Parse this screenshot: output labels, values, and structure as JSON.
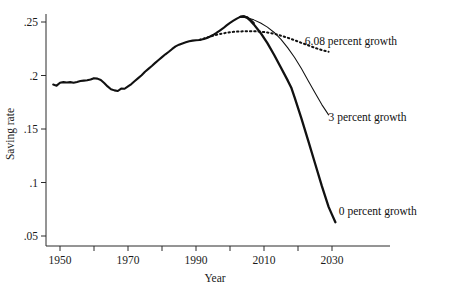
{
  "chart_data": {
    "type": "line",
    "title": "",
    "xlabel": "Year",
    "ylabel": "Saving rate",
    "xlim": [
      1946,
      2039
    ],
    "ylim": [
      0.042,
      0.262
    ],
    "grid": false,
    "legend": "inline-annotations",
    "x_ticks": [
      1950,
      1960,
      1970,
      1980,
      1990,
      2000,
      2010,
      2020,
      2030
    ],
    "x_tick_labels": [
      "1950",
      "",
      "1970",
      "",
      "1990",
      "",
      "2010",
      "",
      "2030"
    ],
    "y_ticks": [
      0.05,
      0.1,
      0.15,
      0.2,
      0.25
    ],
    "y_tick_labels": [
      ".05",
      ".1",
      ".15",
      ".2",
      ".25"
    ],
    "annotations": [
      {
        "name": "six-growth-label",
        "text": "6.08 percent growth",
        "x": 2022,
        "y": 0.232
      },
      {
        "name": "three-growth-label",
        "text": "3 percent growth",
        "x": 2029,
        "y": 0.161
      },
      {
        "name": "zero-growth-label",
        "text": "0 percent growth",
        "x": 2032,
        "y": 0.073
      }
    ],
    "series": [
      {
        "name": "Historical saving rate",
        "style": "solid-thick",
        "points": [
          [
            1948,
            0.1915
          ],
          [
            1949,
            0.1905
          ],
          [
            1950,
            0.1932
          ],
          [
            1951,
            0.1938
          ],
          [
            1952,
            0.1934
          ],
          [
            1953,
            0.1938
          ],
          [
            1954,
            0.1933
          ],
          [
            1955,
            0.194
          ],
          [
            1956,
            0.1948
          ],
          [
            1957,
            0.1952
          ],
          [
            1958,
            0.1955
          ],
          [
            1959,
            0.1962
          ],
          [
            1960,
            0.1975
          ],
          [
            1961,
            0.1971
          ],
          [
            1962,
            0.1958
          ],
          [
            1963,
            0.193
          ],
          [
            1964,
            0.1898
          ],
          [
            1965,
            0.1872
          ],
          [
            1966,
            0.1861
          ],
          [
            1967,
            0.1855
          ],
          [
            1968,
            0.1878
          ],
          [
            1969,
            0.1876
          ],
          [
            1970,
            0.1899
          ],
          [
            1971,
            0.192
          ],
          [
            1972,
            0.1948
          ],
          [
            1973,
            0.1975
          ],
          [
            1974,
            0.2002
          ],
          [
            1975,
            0.2035
          ],
          [
            1976,
            0.2062
          ],
          [
            1977,
            0.2089
          ],
          [
            1978,
            0.2118
          ],
          [
            1979,
            0.2145
          ],
          [
            1980,
            0.2172
          ],
          [
            1981,
            0.2198
          ],
          [
            1982,
            0.2222
          ],
          [
            1983,
            0.2248
          ],
          [
            1984,
            0.2272
          ],
          [
            1985,
            0.2288
          ],
          [
            1986,
            0.23
          ],
          [
            1987,
            0.231
          ],
          [
            1988,
            0.232
          ],
          [
            1989,
            0.2326
          ],
          [
            1990,
            0.233
          ],
          [
            1991,
            0.2332
          ],
          [
            1992,
            0.2338
          ],
          [
            1993,
            0.2348
          ],
          [
            1994,
            0.2362
          ],
          [
            1995,
            0.2378
          ],
          [
            1996,
            0.2398
          ],
          [
            1997,
            0.242
          ],
          [
            1998,
            0.2442
          ],
          [
            1999,
            0.2468
          ],
          [
            2000,
            0.2492
          ],
          [
            2001,
            0.2512
          ],
          [
            2002,
            0.2532
          ],
          [
            2003,
            0.2548
          ],
          [
            2004,
            0.2553
          ],
          [
            2005,
            0.2545
          ],
          [
            2006,
            0.252
          ],
          [
            2007,
            0.249
          ]
        ]
      },
      {
        "name": "6.08 percent growth",
        "style": "dotted",
        "points": [
          [
            1991,
            0.2332
          ],
          [
            1993,
            0.2352
          ],
          [
            1995,
            0.2372
          ],
          [
            1997,
            0.2388
          ],
          [
            1999,
            0.24
          ],
          [
            2001,
            0.2408
          ],
          [
            2003,
            0.2412
          ],
          [
            2005,
            0.2414
          ],
          [
            2007,
            0.2414
          ],
          [
            2009,
            0.241
          ],
          [
            2011,
            0.2402
          ],
          [
            2013,
            0.239
          ],
          [
            2015,
            0.2372
          ],
          [
            2017,
            0.2352
          ],
          [
            2019,
            0.233
          ],
          [
            2021,
            0.2305
          ],
          [
            2023,
            0.2282
          ],
          [
            2025,
            0.2258
          ],
          [
            2027,
            0.2238
          ],
          [
            2029,
            0.2222
          ]
        ]
      },
      {
        "name": "3 percent growth",
        "style": "solid-thin",
        "points": [
          [
            2003,
            0.2548
          ],
          [
            2005,
            0.254
          ],
          [
            2007,
            0.252
          ],
          [
            2009,
            0.249
          ],
          [
            2011,
            0.2452
          ],
          [
            2013,
            0.2402
          ],
          [
            2015,
            0.2338
          ],
          [
            2017,
            0.2258
          ],
          [
            2019,
            0.2168
          ],
          [
            2021,
            0.2065
          ],
          [
            2023,
            0.1952
          ],
          [
            2025,
            0.1838
          ],
          [
            2027,
            0.1728
          ],
          [
            2029,
            0.1632
          ]
        ]
      },
      {
        "name": "0 percent growth",
        "style": "solid-thick",
        "points": [
          [
            2003,
            0.2548
          ],
          [
            2004,
            0.2553
          ],
          [
            2005,
            0.254
          ],
          [
            2006,
            0.2512
          ],
          [
            2007,
            0.2478
          ],
          [
            2009,
            0.2398
          ],
          [
            2011,
            0.2302
          ],
          [
            2013,
            0.2192
          ],
          [
            2015,
            0.2072
          ],
          [
            2017,
            0.1952
          ],
          [
            2018,
            0.1888
          ],
          [
            2019,
            0.1795
          ],
          [
            2021,
            0.16
          ],
          [
            2023,
            0.1392
          ],
          [
            2025,
            0.118
          ],
          [
            2027,
            0.0968
          ],
          [
            2029,
            0.0772
          ],
          [
            2030,
            0.07
          ],
          [
            2031,
            0.0628
          ]
        ]
      }
    ]
  }
}
